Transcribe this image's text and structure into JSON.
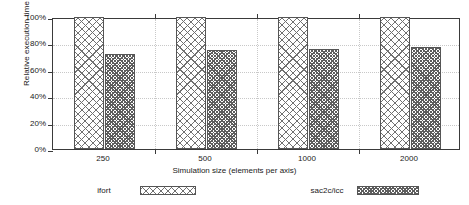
{
  "chart_data": {
    "type": "bar",
    "title": "",
    "xlabel": "Simulation size (elements per axis)",
    "ylabel": "Relative execution time",
    "categories": [
      "250",
      "500",
      "1000",
      "2000"
    ],
    "series": [
      {
        "name": "ifort",
        "values": [
          100,
          100,
          100,
          100
        ]
      },
      {
        "name": "sac2c/icc",
        "values": [
          72,
          75,
          76,
          77
        ]
      }
    ],
    "ylim": [
      0,
      100
    ],
    "yticks": [
      0,
      20,
      40,
      60,
      80,
      100
    ],
    "ytick_labels": [
      "0%",
      "20%",
      "40%",
      "60%",
      "80%",
      "100%"
    ],
    "grid": true,
    "legend_position": "bottom",
    "value_suffix": "%"
  },
  "legend": {
    "entries": [
      {
        "label": "ifort",
        "pattern": "crosshatch"
      },
      {
        "label": "sac2c/icc",
        "pattern": "dots"
      }
    ]
  },
  "colors": {
    "frame": "#3a3a3a",
    "grid": "#c8c8c8",
    "bar_outline": "#555555",
    "pattern": "#707070",
    "background": "#ffffff",
    "text": "#1a1a1a"
  }
}
